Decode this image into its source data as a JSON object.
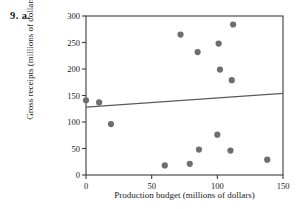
{
  "problem": {
    "label": "9.  a."
  },
  "chart_data": {
    "type": "scatter",
    "title": "",
    "xlabel": "Production budget (millions of dollars)",
    "ylabel": "Gross receipts (millions of dollars)",
    "xlim": [
      0,
      150
    ],
    "ylim": [
      0,
      300
    ],
    "xticks": [
      0,
      50,
      100,
      150
    ],
    "yticks": [
      0,
      50,
      100,
      150,
      200,
      250,
      300
    ],
    "xtick_labels": [
      "0",
      "50",
      "100",
      "150"
    ],
    "ytick_labels": [
      "0",
      "50",
      "100",
      "150",
      "200",
      "250",
      "300"
    ],
    "grid": false,
    "legend": false,
    "point_color": "#6e6e6e",
    "line_color": "#5a5a5a",
    "axis_color": "#3c3c3c",
    "points": [
      {
        "x": 0,
        "y": 141
      },
      {
        "x": 10,
        "y": 137
      },
      {
        "x": 19,
        "y": 96
      },
      {
        "x": 60,
        "y": 18
      },
      {
        "x": 72,
        "y": 265
      },
      {
        "x": 79,
        "y": 21
      },
      {
        "x": 85,
        "y": 232
      },
      {
        "x": 86,
        "y": 48
      },
      {
        "x": 100,
        "y": 76
      },
      {
        "x": 101,
        "y": 248
      },
      {
        "x": 102,
        "y": 199
      },
      {
        "x": 110,
        "y": 46
      },
      {
        "x": 111,
        "y": 179
      },
      {
        "x": 112,
        "y": 284
      },
      {
        "x": 138,
        "y": 29
      }
    ],
    "trend_line": {
      "type": "least-squares",
      "x0": 0,
      "y0": 128,
      "x1": 150,
      "y1": 154
    }
  }
}
